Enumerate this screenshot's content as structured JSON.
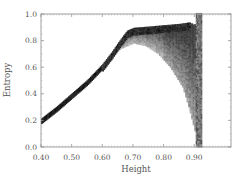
{
  "chart_data": {
    "type": "heatmap",
    "title": "",
    "xlabel": "Height",
    "ylabel": "Entropy",
    "xlim": [
      0.4,
      1.02
    ],
    "ylim": [
      0.0,
      1.0
    ],
    "xticks": [
      "0.40",
      "0.50",
      "0.60",
      "0.70",
      "0.80",
      "0.90"
    ],
    "xtick_values": [
      0.4,
      0.5,
      0.6,
      0.7,
      0.8,
      0.9
    ],
    "yticks": [
      "0.0",
      "0.2",
      "0.4",
      "0.6",
      "0.8",
      "1.0"
    ],
    "ytick_values": [
      0.0,
      0.2,
      0.4,
      0.6,
      0.8,
      1.0
    ],
    "grid": false,
    "legend": null,
    "colormap": "grayscale (darker = higher density)",
    "ridge": {
      "x": [
        0.4,
        0.45,
        0.5,
        0.55,
        0.6,
        0.63,
        0.66,
        0.68,
        0.7,
        0.75,
        0.8,
        0.85,
        0.88
      ],
      "y": [
        0.2,
        0.29,
        0.39,
        0.49,
        0.61,
        0.7,
        0.8,
        0.86,
        0.88,
        0.89,
        0.9,
        0.91,
        0.92
      ]
    },
    "cloud_lower_edge": {
      "x": [
        0.62,
        0.66,
        0.7,
        0.74,
        0.78,
        0.82,
        0.86,
        0.88,
        0.9,
        0.91
      ],
      "y": [
        0.68,
        0.74,
        0.78,
        0.76,
        0.7,
        0.6,
        0.45,
        0.3,
        0.12,
        0.02
      ]
    },
    "vertical_band": {
      "x_range": [
        0.905,
        0.925
      ],
      "y_range": [
        0.0,
        1.0
      ]
    },
    "gap_right_of_plateau": {
      "x_range": [
        0.88,
        0.905
      ],
      "y_range": [
        0.4,
        1.0
      ]
    }
  }
}
